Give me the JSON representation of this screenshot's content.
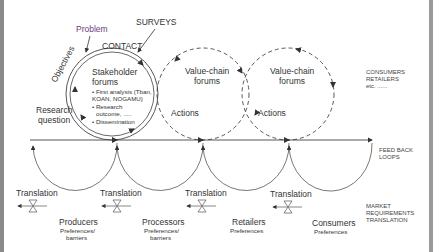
{
  "diagram": {
    "top_labels": {
      "problem": "Problem",
      "surveys": "SURVEYS",
      "contact": "CONTACT",
      "objectives": "Objectives",
      "research_question_1": "Research",
      "research_question_2": "question"
    },
    "stakeholder_forum": {
      "title_1": "Stakeholder",
      "title_2": "forums",
      "bullets": [
        "• First analysis (Tban,",
        "KOAN, NOGAMU)",
        "• Research",
        "outcome, .....",
        "• Dissemination"
      ]
    },
    "value_chain_forums": [
      {
        "title_1": "Value-chain",
        "title_2": "forums",
        "action": "Actions"
      },
      {
        "title_1": "Value-chain",
        "title_2": "forums",
        "action": "Actions"
      }
    ],
    "right_labels": {
      "consumers_retailers": [
        "CONSUMERS",
        "RETAILERS",
        "etc. ......"
      ],
      "feedback_loops": [
        "FEED BACK",
        "LOOPS"
      ],
      "market_requirements": [
        "MARKET",
        "REQUIREMENTS",
        "TRANSLATION"
      ]
    },
    "translation_label": "Translation",
    "actors": [
      {
        "name": "Producers",
        "detail_1": "Preferences/",
        "detail_2": "barriers"
      },
      {
        "name": "Processors",
        "detail_1": "Preferences/",
        "detail_2": "barriers"
      },
      {
        "name": "Retailers",
        "detail_1": "Preferences",
        "detail_2": ""
      },
      {
        "name": "Consumers",
        "detail_1": "Preferences",
        "detail_2": ""
      }
    ],
    "colors": {
      "line": "#444444",
      "border": "#8a8a8a",
      "accent_purple": "#6a3d7a"
    }
  }
}
